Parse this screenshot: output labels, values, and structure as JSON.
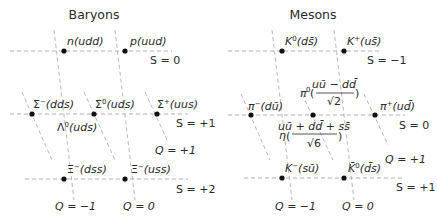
{
  "baryons": {
    "title": "Baryons",
    "particles": [
      {
        "name": "n",
        "sup": "",
        "quarks": "(udd)"
      },
      {
        "name": "p",
        "sup": "",
        "quarks": "(uud)"
      },
      {
        "name": "Σ",
        "sup": "−",
        "quarks": "(dds)"
      },
      {
        "name": "Σ",
        "sup": "0",
        "quarks": "(uds)"
      },
      {
        "name": "Σ",
        "sup": "+",
        "quarks": "(uus)"
      },
      {
        "name": "Λ",
        "sup": "0",
        "quarks": "(uds)"
      },
      {
        "name": "Ξ",
        "sup": "−",
        "quarks": "(dss)"
      },
      {
        "name": "Ξ",
        "sup": "−",
        "quarks": "(uss)"
      }
    ],
    "strangeness": [
      "S = 0",
      "S = +1",
      "S = +2"
    ],
    "charge": [
      "Q = −1",
      "Q = 0",
      "Q = +1"
    ]
  },
  "mesons": {
    "title": "Mesons",
    "particles": [
      {
        "name": "K",
        "sup": "0",
        "quarks": "(ds̄)"
      },
      {
        "name": "K",
        "sup": "+",
        "quarks": "(us̄)"
      },
      {
        "name": "π",
        "sup": "−",
        "quarks": "(dū)"
      },
      {
        "name": "π",
        "sup": "0",
        "quarks": "(uū − dd̄)/√2"
      },
      {
        "name": "π",
        "sup": "+",
        "quarks": "(ud̄)"
      },
      {
        "name": "η",
        "sup": "",
        "quarks": "(uū + dd̄ + ss̄)/√6"
      },
      {
        "name": "K",
        "sup": "−",
        "quarks": "(sū)"
      },
      {
        "name": "K̄",
        "sup": "0",
        "quarks": "(d̄s)"
      }
    ],
    "pi0_num": "uū − dd̄",
    "pi0_den": "√2",
    "eta_num": "uū + dd̄ + ss̄",
    "eta_den": "√6",
    "strangeness": [
      "S = −1",
      "S = 0",
      "S = +1"
    ],
    "charge": [
      "Q = −1",
      "Q = 0",
      "Q = +1"
    ]
  }
}
